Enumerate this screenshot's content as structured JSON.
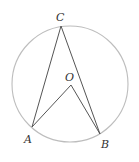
{
  "diagram": {
    "type": "circle-geometry",
    "colors": {
      "circle": "#bdbdbd",
      "lines": "#555555",
      "labels": "#333333",
      "background": "#ffffff"
    },
    "circle": {
      "cx": 70,
      "cy": 84,
      "r": 58
    },
    "points": {
      "A": {
        "x": 32,
        "y": 127
      },
      "B": {
        "x": 100,
        "y": 134
      },
      "C": {
        "x": 61,
        "y": 26
      },
      "O": {
        "x": 71,
        "y": 85
      }
    },
    "labels": {
      "A": "A",
      "B": "B",
      "C": "C",
      "O": "O"
    },
    "segments": [
      "CA",
      "CB",
      "OA",
      "OB"
    ]
  }
}
